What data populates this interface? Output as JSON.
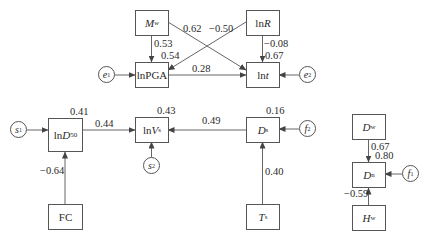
{
  "nodes": {
    "mw": {
      "main": "M",
      "sub": "w",
      "italic": true
    },
    "lnr": {
      "pre": "ln",
      "main": "R",
      "italic_main": true
    },
    "lnpga": {
      "text": "lnPGA"
    },
    "lnt": {
      "pre": "ln",
      "main": "t",
      "italic_main": true
    },
    "lnd50": {
      "pre": "ln",
      "main": "D",
      "sub": "50",
      "italic_main": true
    },
    "lnvs": {
      "pre": "ln",
      "main": "V",
      "sub": "s",
      "italic_main": true
    },
    "ds": {
      "main": "D",
      "sub": "s",
      "italic": true
    },
    "fc": {
      "text": "FC"
    },
    "ts": {
      "main": "T",
      "sub": "s",
      "italic": true
    },
    "dw": {
      "main": "D",
      "sub": "w",
      "italic": true
    },
    "dn": {
      "main": "D",
      "sub": "n",
      "italic": true
    },
    "hw": {
      "main": "H",
      "sub": "w",
      "italic": true
    }
  },
  "errors": {
    "e1": {
      "main": "e",
      "sub": "1"
    },
    "e2": {
      "main": "e",
      "sub": "2"
    },
    "s1": {
      "main": "s",
      "sub": "1"
    },
    "s2": {
      "main": "s",
      "sub": "2"
    },
    "f1": {
      "main": "f",
      "sub": "1"
    },
    "f2": {
      "main": "f",
      "sub": "2"
    }
  },
  "paths": {
    "mw_lnpga": "0.53",
    "mw_lnt": "0.62",
    "lnr_lnpga": "−0.50",
    "lnr_lnt": "−0.08",
    "lnpga_lnt": "0.28",
    "lnd50_lnvs": "0.44",
    "ds_lnvs": "0.49",
    "fc_lnd50": "−0.64",
    "ts_ds": "0.40",
    "dw_dn": "0.67",
    "hw_dn": "−0.59"
  },
  "r_squared": {
    "lnpga": "0.54",
    "lnt": "0.67",
    "lnd50": "0.41",
    "lnvs": "0.43",
    "ds": "0.16",
    "dn": "0.80"
  },
  "colors": {
    "line": "#555555",
    "text": "#2a2a2a",
    "background": "#ffffff"
  }
}
